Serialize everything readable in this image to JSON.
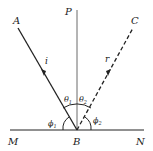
{
  "diagram": {
    "points": {
      "A": "A",
      "B": "B",
      "C": "C",
      "M": "M",
      "N": "N",
      "P": "P"
    },
    "rays": {
      "incident": "i",
      "reflected": "r"
    },
    "angles": {
      "theta1": "θ",
      "theta1_sub": "1",
      "theta2": "θ",
      "theta2_sub": "2",
      "phi1": "ϕ",
      "phi1_sub": "1",
      "phi2": "ϕ",
      "phi2_sub": "2"
    },
    "colors": {
      "stroke": "#222222",
      "background": "#ffffff"
    }
  }
}
